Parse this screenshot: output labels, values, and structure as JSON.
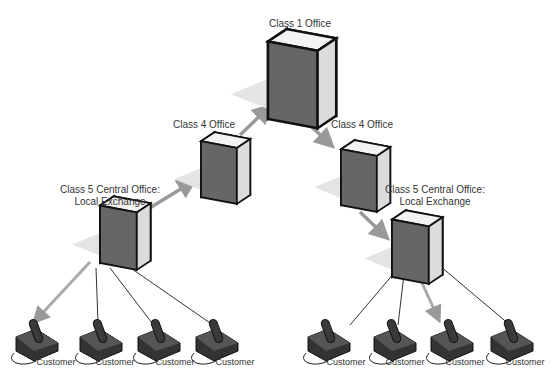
{
  "labels": {
    "class1": "Class 1 Office",
    "class4_left": "Class 4 Office",
    "class4_right": "Class 4 Office",
    "class5_left_line1": "Class 5 Central Office:",
    "class5_left_line2": "Local Exchange",
    "class5_right_line1": "Class 5 Central Office:",
    "class5_right_line2": "Local Exchange"
  },
  "customers": [
    "Customer",
    "Customer",
    "Customer",
    "Customer",
    "Customer",
    "Customer",
    "Customer",
    "Customer"
  ],
  "colors": {
    "arrow": "#999999",
    "line": "#333333",
    "switch_front": "#d4d4d4",
    "switch_side": "#6a6a6a",
    "switch_top": "#eeeeee"
  }
}
